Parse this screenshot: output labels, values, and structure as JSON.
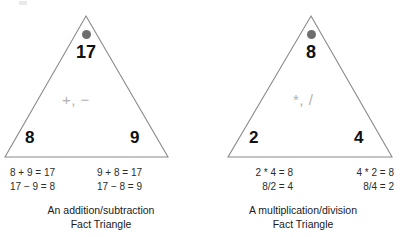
{
  "figure": {
    "panels": [
      {
        "id": "addition-subtraction",
        "apex_dot": "gray-dot-icon",
        "apex_number": "17",
        "operators": "+, −",
        "left_number": "8",
        "right_number": "9",
        "equation_columns": [
          {
            "lines": [
              "8 + 9 = 17",
              "17 − 9 = 8"
            ]
          },
          {
            "lines": [
              "9 + 8 = 17",
              "17 − 8 = 9"
            ]
          }
        ],
        "caption_lines": [
          "An addition/subtraction",
          "Fact Triangle"
        ]
      },
      {
        "id": "multiplication-division",
        "apex_dot": "gray-dot-icon",
        "apex_number": "8",
        "operators": "*, /",
        "left_number": "2",
        "right_number": "4",
        "equation_columns": [
          {
            "lines": [
              "2 * 4 = 8",
              "8/2 = 4"
            ]
          },
          {
            "lines": [
              "4 * 2 = 8",
              "8/4 = 2"
            ]
          }
        ],
        "caption_lines": [
          "A multiplication/division",
          "Fact Triangle"
        ]
      }
    ]
  },
  "colors": {
    "triangle_stroke": "#8a8a8a",
    "apex_dot": "#6e6e6e",
    "operator_text": "#b2b2b2",
    "number_text": "#111111",
    "equation_text": "#2b2b2b",
    "caption_text": "#1a1a1a",
    "background": "#ffffff"
  }
}
